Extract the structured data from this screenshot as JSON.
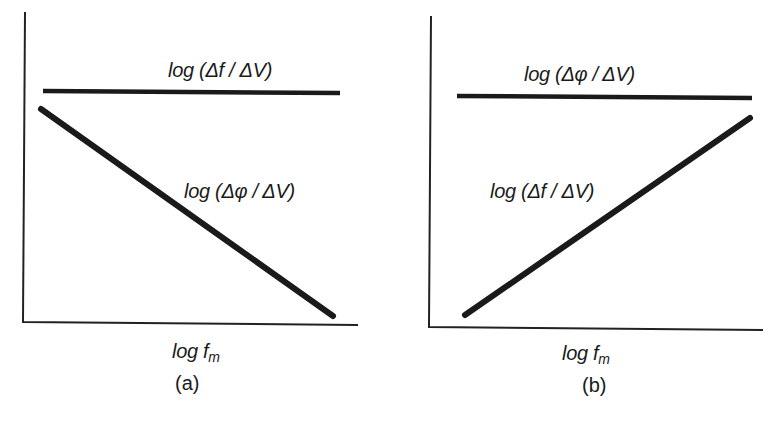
{
  "panels": [
    {
      "id": "a",
      "caption": "(a)",
      "xlabel_main": "log f",
      "xlabel_sub": "m",
      "curves": [
        {
          "name": "horizontal-line",
          "label": "log (Δf / ΔV)",
          "trend": "constant"
        },
        {
          "name": "decreasing-line",
          "label": "log (Δφ / ΔV)",
          "trend": "decreasing"
        }
      ]
    },
    {
      "id": "b",
      "caption": "(b)",
      "xlabel_main": "log f",
      "xlabel_sub": "m",
      "curves": [
        {
          "name": "horizontal-line",
          "label": "log (Δφ / ΔV)",
          "trend": "constant"
        },
        {
          "name": "increasing-line",
          "label": "log (Δf / ΔV)",
          "trend": "increasing"
        }
      ]
    }
  ],
  "colors": {
    "line": "#1a1a1a",
    "axis": "#222222",
    "background": "#ffffff"
  }
}
